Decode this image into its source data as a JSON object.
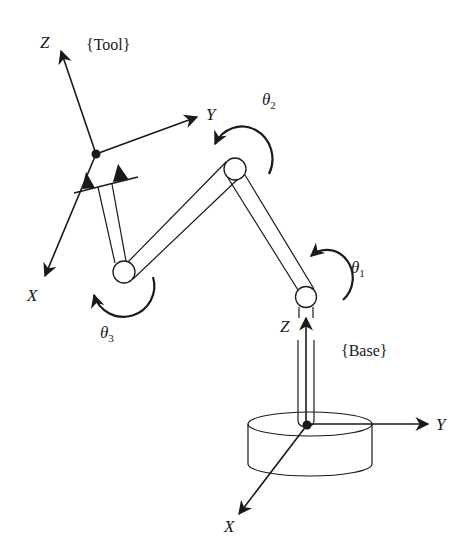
{
  "diagram": {
    "type": "robot-manipulator-kinematics",
    "frames": {
      "tool": {
        "label": "{Tool}",
        "axes": {
          "x": "X",
          "y": "Y",
          "z": "Z"
        }
      },
      "base": {
        "label": "{Base}",
        "axes": {
          "x": "X",
          "y": "Y",
          "z": "Z"
        }
      }
    },
    "joints": [
      {
        "id": "joint-1",
        "angle_label": "θ",
        "subscript": "1"
      },
      {
        "id": "joint-2",
        "angle_label": "θ",
        "subscript": "2"
      },
      {
        "id": "joint-3",
        "angle_label": "θ",
        "subscript": "3"
      }
    ],
    "colors": {
      "ink": "#1a1a1a",
      "background": "#ffffff"
    }
  }
}
